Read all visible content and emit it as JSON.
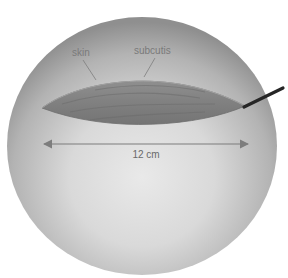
{
  "figure": {
    "labels": {
      "skin": "skin",
      "subcutis": "subcutis"
    },
    "measurement": {
      "value": "12 cm"
    },
    "colors": {
      "sphere_light": "#e6e6e6",
      "sphere_mid": "#b9b9b9",
      "sphere_dark": "#8e8e8e",
      "wound": "#8a8a8a",
      "wound_dark": "#6f6f6f",
      "label_text": "#7a7a7a",
      "arrow": "#7d7d7d",
      "drain": "#2a2a2a"
    }
  }
}
